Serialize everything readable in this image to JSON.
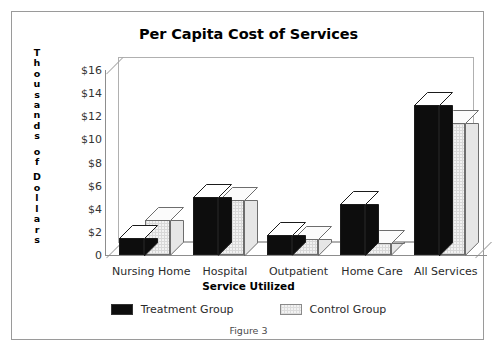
{
  "figure": {
    "caption": "Figure 3"
  },
  "chart_data": {
    "type": "bar",
    "title": "Per Capita Cost of Services",
    "xlabel": "Service Utilized",
    "ylabel": "Thousands of Dollars",
    "categories": [
      "Nursing Home",
      "Hospital",
      "Outpatient",
      "Home Care",
      "All Services"
    ],
    "series": [
      {
        "name": "Treatment Group",
        "color": "#0d0d0d",
        "values": [
          1.5,
          5.0,
          1.7,
          4.4,
          13.0
        ]
      },
      {
        "name": "Control Group",
        "color": "#f2f2f2",
        "values": [
          3.0,
          4.8,
          1.4,
          1.0,
          11.4
        ]
      }
    ],
    "ylim": [
      0,
      16
    ],
    "y_ticks": [
      0,
      2,
      4,
      6,
      8,
      10,
      12,
      14,
      16
    ],
    "y_tick_labels": [
      "0",
      "$2",
      "$4",
      "$6",
      "$8",
      "$10",
      "$12",
      "$14",
      "$16"
    ],
    "grid": false,
    "legend_position": "bottom",
    "style_3d": true
  },
  "legend": {
    "items": [
      {
        "label": "Treatment Group",
        "swatch": "treatment"
      },
      {
        "label": "Control Group",
        "swatch": "control"
      }
    ]
  }
}
